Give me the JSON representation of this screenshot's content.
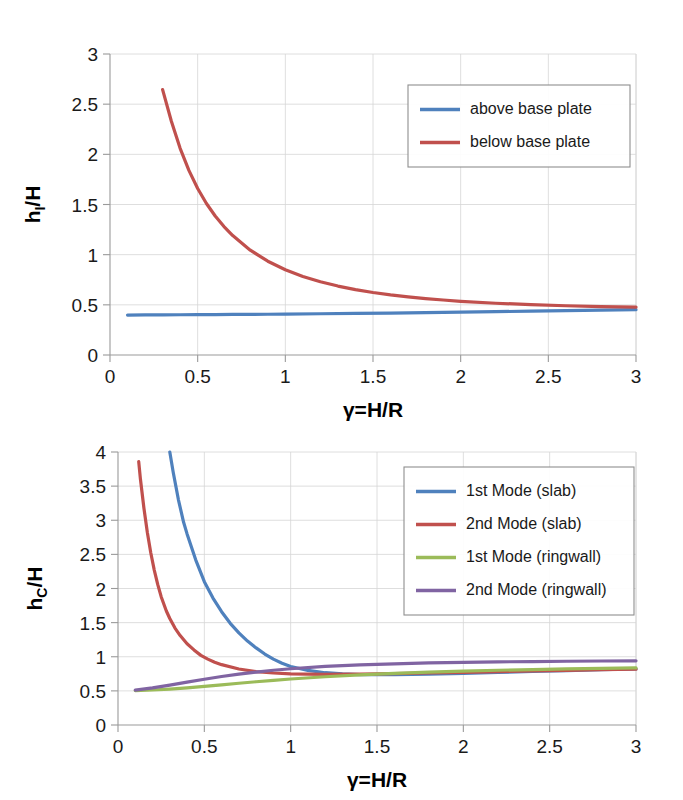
{
  "chart_data": [
    {
      "id": "impulsive-height-ratio",
      "type": "line",
      "title": "",
      "xlabel": "γ=H/R",
      "ylabel": "hᵢ/H",
      "ylabel_base": "h",
      "ylabel_sub": "I",
      "ylabel_tail": "/H",
      "xlim": [
        0,
        3
      ],
      "ylim": [
        0,
        3
      ],
      "xticks": [
        0,
        0.5,
        1,
        1.5,
        2,
        2.5,
        3
      ],
      "xticklabels": [
        "0",
        "0.5",
        "1",
        "1.5",
        "2",
        "2.5",
        "3"
      ],
      "yticks": [
        0,
        0.5,
        1,
        1.5,
        2,
        2.5,
        3
      ],
      "yticklabels": [
        "0",
        "0.5",
        "1",
        "1.5",
        "2",
        "2.5",
        "3"
      ],
      "grid": true,
      "legend_position": "upper right",
      "series": [
        {
          "name": "above base plate",
          "color": "#4f81bd",
          "x": [
            0.1,
            0.2,
            0.3,
            0.4,
            0.5,
            0.6,
            0.7,
            0.8,
            0.9,
            1.0,
            1.2,
            1.4,
            1.6,
            1.8,
            2.0,
            2.2,
            2.4,
            2.6,
            2.8,
            3.0
          ],
          "y": [
            0.398,
            0.399,
            0.4,
            0.401,
            0.402,
            0.403,
            0.404,
            0.405,
            0.406,
            0.408,
            0.411,
            0.414,
            0.418,
            0.422,
            0.427,
            0.432,
            0.437,
            0.442,
            0.447,
            0.452
          ]
        },
        {
          "name": "below base plate",
          "color": "#c0504d",
          "x": [
            0.3,
            0.35,
            0.4,
            0.45,
            0.5,
            0.55,
            0.6,
            0.65,
            0.7,
            0.8,
            0.9,
            1.0,
            1.1,
            1.2,
            1.3,
            1.4,
            1.5,
            1.6,
            1.7,
            1.8,
            1.9,
            2.0,
            2.2,
            2.4,
            2.6,
            2.8,
            3.0
          ],
          "y": [
            2.645,
            2.33,
            2.06,
            1.84,
            1.66,
            1.51,
            1.385,
            1.28,
            1.19,
            1.045,
            0.935,
            0.85,
            0.783,
            0.73,
            0.687,
            0.652,
            0.623,
            0.599,
            0.579,
            0.562,
            0.548,
            0.535,
            0.516,
            0.502,
            0.491,
            0.483,
            0.477
          ]
        }
      ]
    },
    {
      "id": "convective-height-ratio",
      "type": "line",
      "title": "",
      "xlabel": "γ=H/R",
      "ylabel": "h_c/H",
      "ylabel_base": "h",
      "ylabel_sub": "C",
      "ylabel_tail": "/H",
      "xlim": [
        0,
        3
      ],
      "ylim": [
        0,
        4
      ],
      "xticks": [
        0,
        0.5,
        1,
        1.5,
        2,
        2.5,
        3
      ],
      "xticklabels": [
        "0",
        "0.5",
        "1",
        "1.5",
        "2",
        "2.5",
        "3"
      ],
      "yticks": [
        0,
        0.5,
        1,
        1.5,
        2,
        2.5,
        3,
        3.5,
        4
      ],
      "yticklabels": [
        "0",
        "0.5",
        "1",
        "1.5",
        "2",
        "2.5",
        "3",
        "3.5",
        "4"
      ],
      "grid": true,
      "legend_position": "upper right",
      "series": [
        {
          "name": "1st Mode (slab)",
          "color": "#4f81bd",
          "x": [
            0.3,
            0.32,
            0.35,
            0.38,
            0.4,
            0.45,
            0.5,
            0.55,
            0.6,
            0.65,
            0.7,
            0.75,
            0.8,
            0.85,
            0.9,
            0.95,
            1.0,
            1.1,
            1.2,
            1.3,
            1.4,
            1.5,
            1.6,
            1.8,
            2.0,
            2.2,
            2.4,
            2.6,
            2.8,
            3.0
          ],
          "y": [
            4.0,
            3.7,
            3.3,
            2.97,
            2.8,
            2.42,
            2.1,
            1.86,
            1.66,
            1.49,
            1.35,
            1.23,
            1.13,
            1.04,
            0.965,
            0.905,
            0.858,
            0.8,
            0.766,
            0.748,
            0.739,
            0.736,
            0.737,
            0.745,
            0.757,
            0.77,
            0.784,
            0.797,
            0.81,
            0.822
          ]
        },
        {
          "name": "2nd Mode (slab)",
          "color": "#c0504d",
          "x": [
            0.12,
            0.13,
            0.15,
            0.17,
            0.19,
            0.21,
            0.23,
            0.25,
            0.28,
            0.3,
            0.33,
            0.36,
            0.4,
            0.44,
            0.48,
            0.52,
            0.56,
            0.6,
            0.7,
            0.8,
            0.9,
            1.0,
            1.2,
            1.4,
            1.6,
            1.8,
            2.0,
            2.2,
            2.4,
            2.6,
            2.8,
            3.0
          ],
          "y": [
            3.86,
            3.6,
            3.18,
            2.82,
            2.52,
            2.27,
            2.06,
            1.88,
            1.67,
            1.56,
            1.42,
            1.31,
            1.19,
            1.1,
            1.02,
            0.965,
            0.92,
            0.884,
            0.82,
            0.783,
            0.762,
            0.75,
            0.742,
            0.745,
            0.752,
            0.762,
            0.772,
            0.782,
            0.792,
            0.801,
            0.81,
            0.818
          ]
        },
        {
          "name": "1st Mode (ringwall)",
          "color": "#9bbb59",
          "x": [
            0.1,
            0.2,
            0.3,
            0.4,
            0.5,
            0.6,
            0.7,
            0.8,
            0.9,
            1.0,
            1.2,
            1.4,
            1.6,
            1.8,
            2.0,
            2.2,
            2.4,
            2.6,
            2.8,
            3.0
          ],
          "y": [
            0.505,
            0.513,
            0.527,
            0.545,
            0.566,
            0.589,
            0.612,
            0.634,
            0.655,
            0.674,
            0.707,
            0.734,
            0.756,
            0.774,
            0.789,
            0.802,
            0.812,
            0.821,
            0.829,
            0.836
          ]
        },
        {
          "name": "2nd Mode (ringwall)",
          "color": "#8064a2",
          "x": [
            0.1,
            0.2,
            0.3,
            0.4,
            0.5,
            0.6,
            0.7,
            0.8,
            0.9,
            1.0,
            1.2,
            1.4,
            1.6,
            1.8,
            2.0,
            2.2,
            2.4,
            2.6,
            2.8,
            3.0
          ],
          "y": [
            0.512,
            0.545,
            0.585,
            0.628,
            0.67,
            0.71,
            0.745,
            0.776,
            0.802,
            0.824,
            0.858,
            0.881,
            0.897,
            0.909,
            0.918,
            0.925,
            0.93,
            0.934,
            0.938,
            0.941
          ]
        }
      ]
    }
  ],
  "colors": {
    "blue": "#4f81bd",
    "red": "#c0504d",
    "green": "#9bbb59",
    "purple": "#8064a2",
    "grid": "#d6d6d6",
    "axis": "#9a9a9a",
    "text": "#1a1a1a",
    "background": "#ffffff"
  }
}
